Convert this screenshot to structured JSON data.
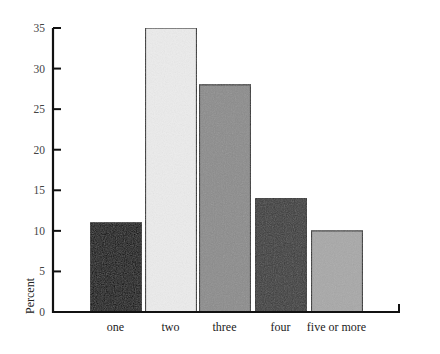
{
  "chart_data": {
    "type": "bar",
    "title": "",
    "xlabel": "",
    "ylabel": "Percent",
    "categories": [
      "one",
      "two",
      "three",
      "four",
      "five or more"
    ],
    "values": [
      11,
      35,
      28,
      14,
      10
    ],
    "ylim": [
      0,
      35
    ],
    "yticks": [
      0,
      5,
      10,
      15,
      20,
      25,
      30,
      35
    ],
    "grid": false,
    "legend": null,
    "bar_colors": [
      "#0a0a0a",
      "#ececec",
      "#8c8c8c",
      "#3a3a3a",
      "#a8a8a8"
    ]
  }
}
